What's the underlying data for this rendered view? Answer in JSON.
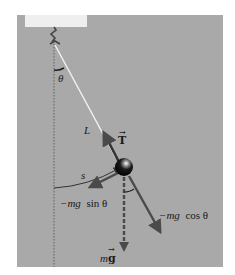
{
  "diagram": {
    "colors": {
      "background": "#ffffff",
      "panel": "#a9a9a9",
      "ceiling": "#efefef",
      "string": "#f4f4f4",
      "vector": "#4a4a4a",
      "ball": "#111111"
    },
    "labels": {
      "theta": "θ",
      "length": "L",
      "tension": "T",
      "arc": "s",
      "tangential_prefix": "−mg",
      "tangential_suffix": "sin θ",
      "radial_prefix": "−mg",
      "radial_suffix": "cos θ",
      "weight_m": "m",
      "weight_g": "g"
    },
    "nodes": [
      {
        "id": "pivot",
        "label": "hook"
      },
      {
        "id": "bob",
        "label": "mass"
      }
    ],
    "edges": [
      {
        "from": "pivot",
        "to": "bob",
        "label": "L"
      }
    ],
    "vectors": [
      {
        "name": "tension",
        "label": "T",
        "direction": "along string toward pivot"
      },
      {
        "name": "weight",
        "label": "mg",
        "direction": "down",
        "style": "dashed"
      },
      {
        "name": "tangential",
        "label": "−mg sin θ",
        "direction": "tangent to arc"
      },
      {
        "name": "radial",
        "label": "−mg cos θ",
        "direction": "along string away from pivot"
      }
    ]
  }
}
